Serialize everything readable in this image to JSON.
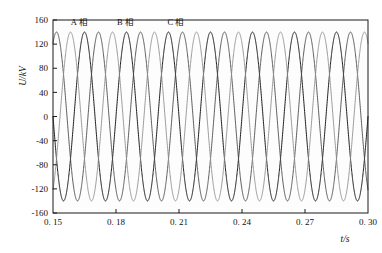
{
  "chart_data": {
    "type": "line",
    "title": "",
    "xlabel": "t/s",
    "ylabel": "U/kV",
    "xlim": [
      0.15,
      0.3
    ],
    "ylim": [
      -160,
      160
    ],
    "grid": false,
    "legend_position": "inside-top-left",
    "x_ticks": [
      0.15,
      0.18,
      0.21,
      0.24,
      0.27,
      0.3
    ],
    "x_tick_labels": [
      "0. 15",
      "0. 18",
      "0. 21",
      "0. 24",
      "0. 27",
      "0. 30"
    ],
    "y_ticks": [
      160,
      120,
      80,
      40,
      0,
      -40,
      -80,
      -120,
      -160
    ],
    "y_tick_labels": [
      "160",
      "120",
      "80",
      "40",
      "0",
      "-40",
      "-80",
      "-120",
      "-160"
    ],
    "frequency_hz": 50,
    "amplitude_kv": 140,
    "series": [
      {
        "name": "A 相",
        "label": "A 相",
        "color": "#1c1c1c",
        "phase_deg": 0,
        "amplitude": 140,
        "stroke_width": 1.0
      },
      {
        "name": "B 相",
        "label": "B 相",
        "color": "#4a4a4a",
        "phase_deg": -120,
        "amplitude": 140,
        "stroke_width": 0.9
      },
      {
        "name": "C 相",
        "label": "C 相",
        "color": "#8f8f8f",
        "phase_deg": 120,
        "amplitude": 140,
        "stroke_width": 0.9
      }
    ],
    "annotations": [
      {
        "text": "A 相",
        "x": 0.1585,
        "y": 152
      },
      {
        "text": "B 相",
        "x": 0.1805,
        "y": 152
      },
      {
        "text": "C 相",
        "x": 0.2045,
        "y": 152
      }
    ]
  },
  "axes": {
    "y_axis_label": "U/kV",
    "x_axis_label": "t/s"
  }
}
